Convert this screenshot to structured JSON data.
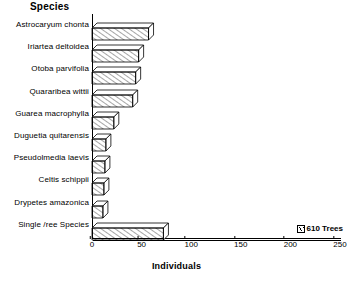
{
  "header": {
    "species_title": "Species"
  },
  "axis": {
    "x_title": "Individuals",
    "ticks": [
      "0",
      "50",
      "100",
      "150",
      "200",
      "250"
    ]
  },
  "legend": {
    "swatch_name": "hatched-swatch",
    "label": "610 Trees"
  },
  "chart_data": {
    "type": "bar",
    "orientation": "horizontal",
    "title": "Species",
    "xlabel": "Individuals",
    "ylabel": "Species",
    "xlim": [
      0,
      250
    ],
    "xticks": [
      0,
      50,
      100,
      150,
      200,
      250
    ],
    "grid": false,
    "legend": [
      "610 Trees"
    ],
    "legend_position": "bottom-right",
    "categories": [
      "Astrocaryum chonta",
      "Iriartea deltoidea",
      "Otoba parvifolia",
      "Quararibea wittii",
      "Guarea macrophylla",
      "Duguetia quitarensis",
      "Pseudolmedia laevis",
      "Celtis schippii",
      "Drypetes amazonica",
      "Single /ree Species"
    ],
    "values": [
      57,
      47,
      44,
      41,
      22,
      14,
      13,
      12,
      11,
      72
    ]
  }
}
